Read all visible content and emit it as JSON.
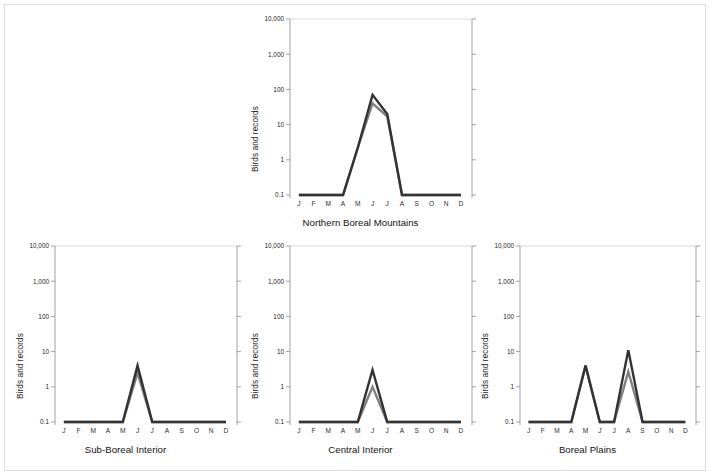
{
  "figure": {
    "ylabel": "Birds and records",
    "y_ticks": [
      "10,000",
      "1,000",
      "100",
      "10",
      "1",
      "0.1"
    ],
    "x_ticks": [
      "J",
      "F",
      "M",
      "A",
      "M",
      "J",
      "J",
      "A",
      "S",
      "O",
      "N",
      "D"
    ],
    "colors": {
      "series_dark": "#333333",
      "series_gray": "#808080",
      "axis": "#8c8c8c",
      "grid": "#c8c8c8",
      "text": "#1a1a1a",
      "page_border": "#dcdcdc"
    }
  },
  "chart_data": [
    {
      "type": "line",
      "title": "Northern Boreal Mountains",
      "xlabel": "Northern Boreal Mountains",
      "ylabel": "Birds and records",
      "categories": [
        "J",
        "F",
        "M",
        "A",
        "M",
        "J",
        "J",
        "A",
        "S",
        "O",
        "N",
        "D"
      ],
      "yscale": "log",
      "ylim": [
        0.1,
        10000
      ],
      "yticks": [
        0.1,
        1,
        10,
        100,
        1000,
        10000
      ],
      "grid": "top-only",
      "legend": "none",
      "series": [
        {
          "name": "Birds",
          "color": "#333333",
          "values": [
            0.1,
            0.1,
            0.1,
            0.1,
            2.2,
            70,
            20,
            0.1,
            0.1,
            0.1,
            0.1,
            0.1
          ]
        },
        {
          "name": "Records",
          "color": "#808080",
          "values": [
            0.1,
            0.1,
            0.1,
            0.1,
            2.2,
            40,
            17,
            0.1,
            0.1,
            0.1,
            0.1,
            0.1
          ]
        }
      ]
    },
    {
      "type": "line",
      "title": "Sub-Boreal Interior",
      "xlabel": "Sub-Boreal Interior",
      "ylabel": "Birds and records",
      "categories": [
        "J",
        "F",
        "M",
        "A",
        "M",
        "J",
        "J",
        "A",
        "S",
        "O",
        "N",
        "D"
      ],
      "yscale": "log",
      "ylim": [
        0.1,
        10000
      ],
      "yticks": [
        0.1,
        1,
        10,
        100,
        1000,
        10000
      ],
      "grid": "top-only",
      "legend": "none",
      "series": [
        {
          "name": "Birds",
          "color": "#333333",
          "values": [
            0.1,
            0.1,
            0.1,
            0.1,
            0.1,
            4,
            0.1,
            0.1,
            0.1,
            0.1,
            0.1,
            0.1
          ]
        },
        {
          "name": "Records",
          "color": "#808080",
          "values": [
            0.1,
            0.1,
            0.1,
            0.1,
            0.1,
            2.5,
            0.1,
            0.1,
            0.1,
            0.1,
            0.1,
            0.1
          ]
        }
      ]
    },
    {
      "type": "line",
      "title": "Central Interior",
      "xlabel": "Central Interior",
      "ylabel": "Birds and records",
      "categories": [
        "J",
        "F",
        "M",
        "A",
        "M",
        "J",
        "J",
        "A",
        "S",
        "O",
        "N",
        "D"
      ],
      "yscale": "log",
      "ylim": [
        0.1,
        10000
      ],
      "yticks": [
        0.1,
        1,
        10,
        100,
        1000,
        10000
      ],
      "grid": "top-only",
      "legend": "none",
      "series": [
        {
          "name": "Birds",
          "color": "#333333",
          "values": [
            0.1,
            0.1,
            0.1,
            0.1,
            0.1,
            3,
            0.1,
            0.1,
            0.1,
            0.1,
            0.1,
            0.1
          ]
        },
        {
          "name": "Records",
          "color": "#808080",
          "values": [
            0.1,
            0.1,
            0.1,
            0.1,
            0.1,
            1.0,
            0.1,
            0.1,
            0.1,
            0.1,
            0.1,
            0.1
          ]
        }
      ]
    },
    {
      "type": "line",
      "title": "Boreal Plains",
      "xlabel": "Boreal Plains",
      "ylabel": "Birds and records",
      "categories": [
        "J",
        "F",
        "M",
        "A",
        "M",
        "J",
        "J",
        "A",
        "S",
        "O",
        "N",
        "D"
      ],
      "yscale": "log",
      "ylim": [
        0.1,
        10000
      ],
      "yticks": [
        0.1,
        1,
        10,
        100,
        1000,
        10000
      ],
      "grid": "top-only",
      "legend": "none",
      "series": [
        {
          "name": "Birds",
          "color": "#333333",
          "values": [
            0.1,
            0.1,
            0.1,
            0.1,
            4,
            0.1,
            0.1,
            11,
            0.1,
            0.1,
            0.1,
            0.1
          ]
        },
        {
          "name": "Records",
          "color": "#808080",
          "values": [
            0.1,
            0.1,
            0.1,
            0.1,
            4,
            0.1,
            0.1,
            2.7,
            0.1,
            0.1,
            0.1,
            0.1
          ]
        }
      ]
    }
  ],
  "panels": [
    {
      "key": "northern_boreal_mountains",
      "title": "Northern Boreal Mountains",
      "ylabel": "Birds and records"
    },
    {
      "key": "sub_boreal_interior",
      "title": "Sub-Boreal Interior",
      "ylabel": "Birds and records"
    },
    {
      "key": "central_interior",
      "title": "Central Interior",
      "ylabel": "Birds and records"
    },
    {
      "key": "boreal_plains",
      "title": "Boreal Plains",
      "ylabel": "Birds and records"
    }
  ]
}
